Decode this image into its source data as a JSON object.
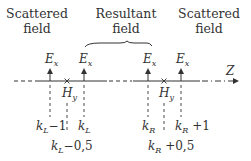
{
  "headers": {
    "left": [
      "Scattered",
      "field"
    ],
    "center": [
      "Resultant",
      "field"
    ],
    "right": [
      "Scattered",
      "field"
    ]
  },
  "axis": {
    "label": "Z"
  },
  "fields": {
    "e_symbol": "E",
    "e_sub": "x",
    "h_symbol": "H",
    "h_sub": "y"
  },
  "labels": {
    "kL_minus_1": {
      "k": "k",
      "sub": "L",
      "rest": "−1"
    },
    "kL": {
      "k": "k",
      "sub": "L",
      "rest": ""
    },
    "kL_minus_half": {
      "k": "k",
      "sub": "L",
      "rest": "−0,5"
    },
    "kR": {
      "k": "k",
      "sub": "R",
      "rest": ""
    },
    "kR_plus_1": {
      "k": "k",
      "sub": "R",
      "rest": " +1"
    },
    "kR_plus_half": {
      "k": "k",
      "sub": "R",
      "rest": " +0,5"
    }
  },
  "colors": {
    "ink": "#333333",
    "background": "#ffffff"
  }
}
